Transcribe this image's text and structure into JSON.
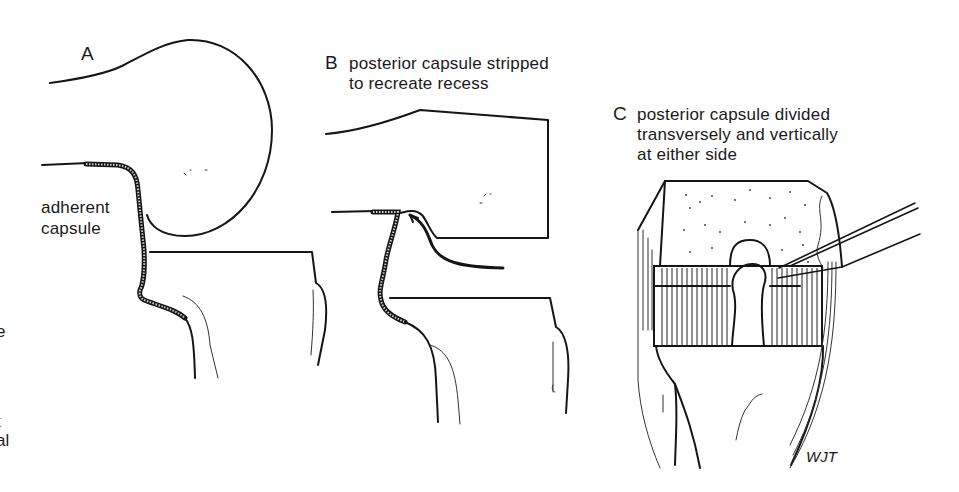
{
  "figure": {
    "panels": [
      {
        "id": "A",
        "letter": "A",
        "caption": "",
        "annotation": [
          "adherent",
          "capsule"
        ]
      },
      {
        "id": "B",
        "letter": "B",
        "caption_lines": [
          "posterior capsule stripped",
          "to recreate recess"
        ]
      },
      {
        "id": "C",
        "letter": "C",
        "caption_lines": [
          "posterior capsule divided",
          "transversely and vertically",
          "at either side"
        ],
        "signature": "WJT"
      }
    ],
    "left_edge_fragments": [
      "e",
      "t",
      "al"
    ],
    "colors": {
      "ink": "#151515",
      "background": "#ffffff"
    }
  }
}
